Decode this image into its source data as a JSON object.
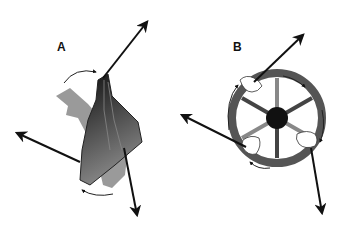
{
  "panels": [
    {
      "id": "A",
      "label": "A",
      "subject": "scapula rotation with force couple"
    },
    {
      "id": "B",
      "label": "B",
      "subject": "steering wheel rotated by hands with force couple"
    }
  ],
  "colors": {
    "arrow": "#111111",
    "dark_fill": "#2a2a2a",
    "light_fill": "#9a9a9a",
    "wheel": "#555555",
    "hub": "#111111"
  }
}
